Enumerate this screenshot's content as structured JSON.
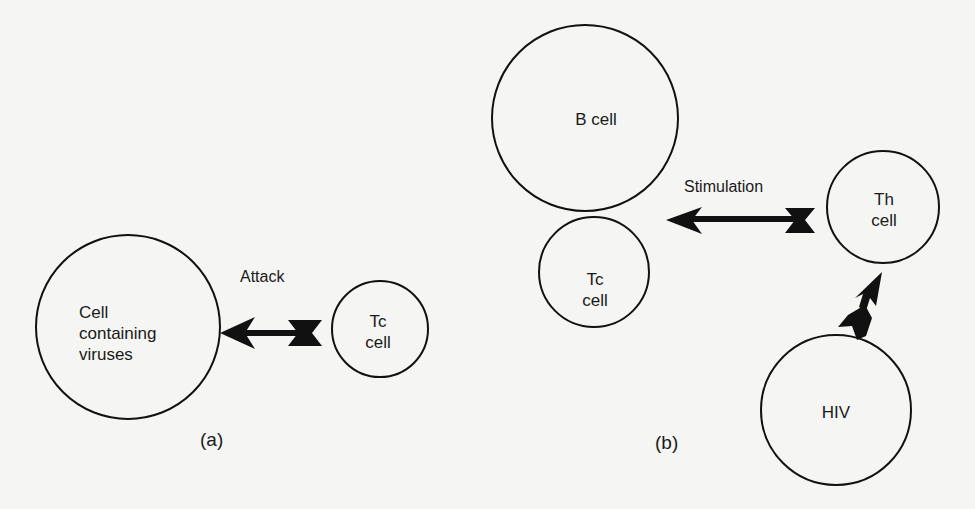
{
  "panels": [
    {
      "id": "a",
      "caption": "(a)",
      "arrow_label": "Attack",
      "cells": [
        {
          "name": "infected-cell",
          "lines": [
            "Cell",
            "containing",
            "viruses"
          ]
        },
        {
          "name": "tc-cell",
          "lines": [
            "Tc",
            "cell"
          ]
        }
      ]
    },
    {
      "id": "b",
      "caption": "(b)",
      "arrow_label": "Stimulation",
      "cells": [
        {
          "name": "b-cell",
          "lines": [
            "B cell"
          ]
        },
        {
          "name": "tc-cell",
          "lines": [
            "Tc",
            "cell"
          ]
        },
        {
          "name": "th-cell",
          "lines": [
            "Th",
            "cell"
          ]
        },
        {
          "name": "hiv",
          "lines": [
            "HIV"
          ]
        }
      ]
    }
  ],
  "colors": {
    "stroke": "#111111",
    "background": "#f5f5f3",
    "text": "#1a1a1a"
  }
}
